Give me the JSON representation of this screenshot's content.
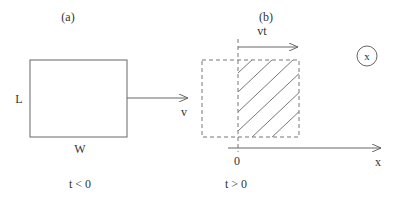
{
  "panel_a": {
    "label": "(a)",
    "length_label": "L",
    "width_label": "W",
    "velocity_label": "v",
    "time_label": "t < 0"
  },
  "panel_b": {
    "label": "(b)",
    "displacement_label": "vt",
    "origin_label": "0",
    "axis_label": "x",
    "circled_label": "x",
    "time_label": "t > 0"
  },
  "colors": {
    "stroke": "#666666",
    "text": "#333333",
    "background": "#ffffff"
  }
}
